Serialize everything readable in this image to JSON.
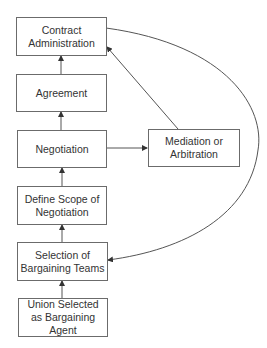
{
  "diagram": {
    "type": "flowchart",
    "nodes": [
      {
        "id": "contract_admin",
        "label": "Contract Administration",
        "lines": [
          "Contract",
          "Administration"
        ]
      },
      {
        "id": "agreement",
        "label": "Agreement",
        "lines": [
          "Agreement"
        ]
      },
      {
        "id": "negotiation",
        "label": "Negotiation",
        "lines": [
          "Negotiation"
        ]
      },
      {
        "id": "mediation",
        "label": "Mediation or Arbitration",
        "lines": [
          "Mediation or",
          "Arbitration"
        ]
      },
      {
        "id": "define_scope",
        "label": "Define Scope of Negotiation",
        "lines": [
          "Define Scope of",
          "Negotiation"
        ]
      },
      {
        "id": "selection",
        "label": "Selection of Bargaining Teams",
        "lines": [
          "Selection of",
          "Bargaining Teams"
        ]
      },
      {
        "id": "union_selected",
        "label": "Union Selected as Bargaining Agent",
        "lines": [
          "Union Selected as",
          "Bargaining Agent"
        ]
      }
    ],
    "edges": [
      {
        "from": "union_selected",
        "to": "selection"
      },
      {
        "from": "selection",
        "to": "define_scope"
      },
      {
        "from": "define_scope",
        "to": "negotiation"
      },
      {
        "from": "negotiation",
        "to": "agreement"
      },
      {
        "from": "agreement",
        "to": "contract_admin"
      },
      {
        "from": "negotiation",
        "to": "mediation"
      },
      {
        "from": "mediation",
        "to": "contract_admin"
      },
      {
        "from": "contract_admin",
        "to": "selection",
        "style": "curved"
      }
    ],
    "colors": {
      "line": "#555555",
      "border": "#6b6b6b",
      "text": "#333333"
    }
  }
}
